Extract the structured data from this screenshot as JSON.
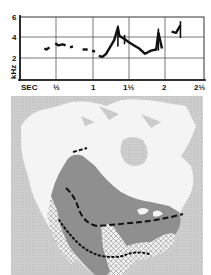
{
  "chart_data": [
    {
      "type": "line",
      "title": "",
      "subtitle": "Sonogram of song",
      "xlabel": "SEC",
      "ylabel": "kHz",
      "xlim": [
        0,
        2.5
      ],
      "ylim": [
        0,
        6
      ],
      "grid": true,
      "x_tick_labels": [
        "SEC",
        "½",
        "1",
        "1½",
        "2",
        "2½"
      ],
      "x_ticks": [
        0,
        0.5,
        1,
        1.5,
        2,
        2.5
      ],
      "y_tick_labels": [
        "2",
        "4",
        "6"
      ],
      "y_ticks": [
        2,
        4,
        6
      ],
      "series": [
        {
          "name": "song trace",
          "x": [
            0.33,
            0.36,
            0.4,
            0.48,
            0.52,
            0.58,
            0.62,
            0.68,
            0.72,
            0.78,
            0.85,
            0.92,
            0.98,
            1.02,
            1.07,
            1.12,
            1.17,
            1.23,
            1.28,
            1.33,
            1.35,
            1.42,
            1.48,
            1.55,
            1.62,
            1.7,
            1.78,
            1.85,
            1.88,
            1.93,
            2.06,
            2.12,
            2.18
          ],
          "values": [
            3.0,
            2.9,
            3.1,
            3.5,
            3.3,
            3.4,
            3.3,
            3.1,
            3.2,
            3.0,
            2.9,
            2.9,
            2.8,
            2.7,
            2.3,
            2.2,
            2.5,
            3.2,
            3.8,
            5.0,
            4.2,
            3.9,
            3.6,
            3.3,
            3.0,
            2.5,
            2.8,
            2.9,
            4.5,
            3.0,
            4.6,
            4.5,
            5.2
          ]
        }
      ]
    },
    {
      "type": "map",
      "title": "Range map",
      "region": "North America",
      "legend": [
        {
          "pattern": "dark gray fill",
          "meaning": "range"
        },
        {
          "pattern": "crosshatch",
          "meaning": "winter range"
        },
        {
          "pattern": "dashed line",
          "meaning": "boundary"
        },
        {
          "pattern": "dotted line",
          "meaning": "boundary"
        }
      ]
    }
  ],
  "colors": {
    "chart_ink": "#111111",
    "grid": "#555555",
    "ocean": "#cfcfcf",
    "land_white": "#f4f4f4",
    "range_fill": "#8e8e8e",
    "hatch": "#d8d8d8"
  },
  "labels": {
    "khz": "kHz",
    "sec": "SEC",
    "x_half": "½",
    "x_one": "1",
    "x_one_half": "1½",
    "x_two": "2",
    "x_two_half": "2½",
    "y_two": "2",
    "y_four": "4",
    "y_six": "6"
  }
}
